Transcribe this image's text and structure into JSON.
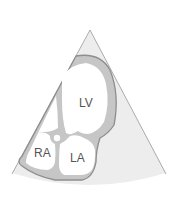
{
  "diagram": {
    "labels": {
      "lv": "LV",
      "ra": "RA",
      "la": "LA"
    },
    "colors": {
      "background": "#ffffff",
      "sector_fill": "#ececec",
      "sector_edge": "#9a9a9a",
      "wall_fill": "#c4c4c4",
      "wall_outline": "#8e8e8e",
      "chamber_fill": "#ffffff",
      "label_text": "#555555"
    }
  }
}
